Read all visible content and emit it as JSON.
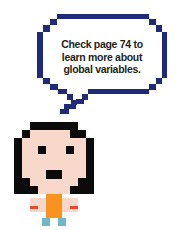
{
  "speech_bubble": {
    "lines": [
      "Check page 74 to",
      "learn more about",
      "global variables."
    ],
    "border_color": "#1f2a78"
  },
  "character": {
    "description": "pixel-art girl with black hair",
    "colors": {
      "hair": "#0b0b0b",
      "skin": "#f8d8cb",
      "shirt": "#f7931e",
      "hand_marks": "#e8482c",
      "feet": "#6fb8cc"
    }
  }
}
